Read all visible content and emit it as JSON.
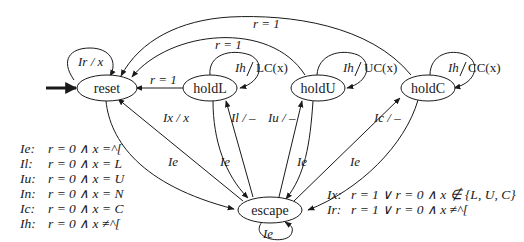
{
  "diagram": {
    "type": "state-machine",
    "initial_state": "reset",
    "nodes": [
      {
        "id": "reset",
        "label": "reset"
      },
      {
        "id": "holdL",
        "label": "holdL"
      },
      {
        "id": "holdU",
        "label": "holdU"
      },
      {
        "id": "holdC",
        "label": "holdC"
      },
      {
        "id": "escape",
        "label": "escape"
      }
    ],
    "edges": [
      {
        "from": "reset",
        "to": "reset",
        "label": "Ir / x"
      },
      {
        "from": "holdL",
        "to": "reset",
        "label": "r = 1"
      },
      {
        "from": "holdU",
        "to": "reset",
        "label": "r = 1"
      },
      {
        "from": "holdC",
        "to": "reset",
        "label": "r = 1"
      },
      {
        "from": "holdL",
        "to": "holdL",
        "label": "Ih / LC(x)"
      },
      {
        "from": "holdU",
        "to": "holdU",
        "label": "Ih / UC(x)"
      },
      {
        "from": "holdC",
        "to": "holdC",
        "label": "Ih / CC(x)"
      },
      {
        "from": "escape",
        "to": "reset",
        "label": "Ix / x"
      },
      {
        "from": "escape",
        "to": "holdL",
        "label": "Il / –"
      },
      {
        "from": "escape",
        "to": "holdU",
        "label": "Iu / –"
      },
      {
        "from": "escape",
        "to": "holdC",
        "label": "Ic / –"
      },
      {
        "from": "reset",
        "to": "escape",
        "label": "Ie"
      },
      {
        "from": "holdL",
        "to": "escape",
        "label": "Ie"
      },
      {
        "from": "holdU",
        "to": "escape",
        "label": "Ie"
      },
      {
        "from": "holdC",
        "to": "escape",
        "label": "Ie"
      },
      {
        "from": "escape",
        "to": "escape",
        "label": "Ie"
      }
    ]
  },
  "labels": {
    "reset_self": "Ir / x",
    "holdL_to_reset": "r = 1",
    "holdU_to_reset": "r = 1",
    "holdC_to_reset": "r = 1",
    "holdL_self_I": "Ih",
    "holdL_self_out": "LC(x)",
    "holdU_self_I": "Ih",
    "holdU_self_out": "UC(x)",
    "holdC_self_I": "Ih",
    "holdC_self_out": "CC(x)",
    "escape_to_reset": "Ix / x",
    "escape_to_holdL": "Il / –",
    "escape_to_holdU": "Iu / –",
    "escape_to_holdC": "Ic / –",
    "reset_to_escape": "Ie",
    "holdL_to_escape": "Ie",
    "holdU_to_escape": "Ie",
    "holdC_to_escape": "Ie",
    "escape_self": "Ie"
  },
  "legend_left": [
    {
      "key": "Ie:",
      "expr": "r = 0 ∧ x =^["
    },
    {
      "key": "Il:",
      "expr": "r = 0 ∧ x = L"
    },
    {
      "key": "Iu:",
      "expr": "r = 0 ∧ x = U"
    },
    {
      "key": "In:",
      "expr": "r = 0 ∧ x = N"
    },
    {
      "key": "Ic:",
      "expr": "r = 0 ∧ x = C"
    },
    {
      "key": "Ih:",
      "expr": "r = 0 ∧ x ≠^["
    }
  ],
  "legend_right": [
    {
      "key": "Ix:",
      "expr": "r = 1 ∨ r = 0 ∧ x ∉ {L, U, C}"
    },
    {
      "key": "Ir:",
      "expr": "r = 1 ∨ r = 0 ∧ x ≠^["
    }
  ]
}
